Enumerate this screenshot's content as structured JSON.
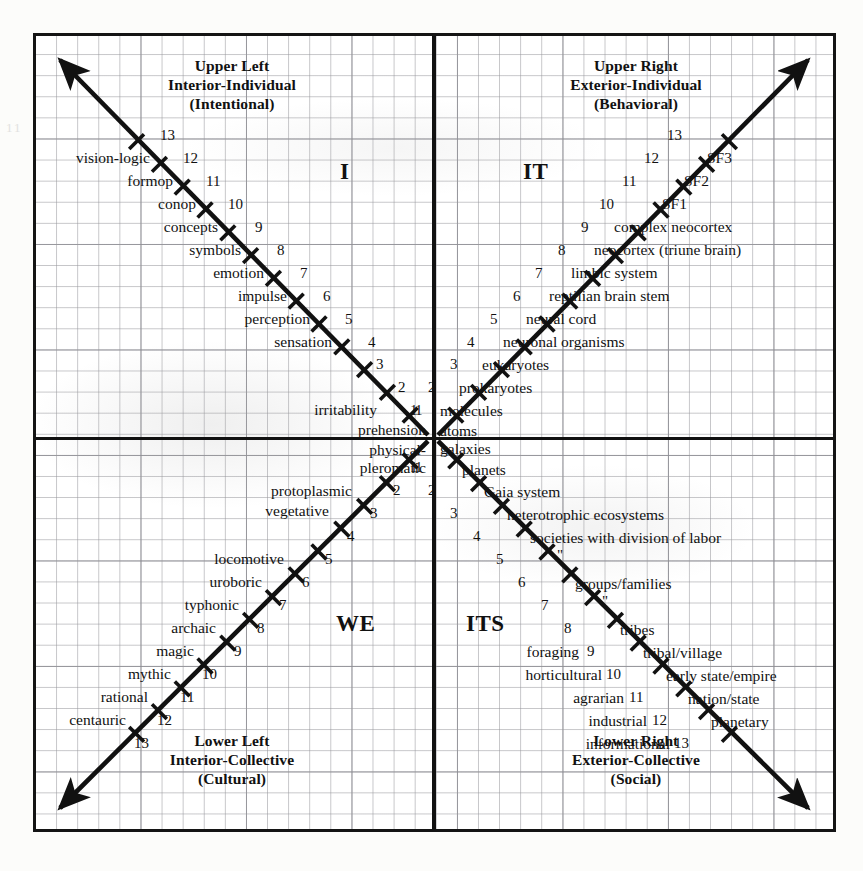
{
  "diagram": {
    "axis_color": "#111111",
    "grid_color": "#969699",
    "frame_color": "#141414"
  },
  "quadrants": {
    "upper_left": {
      "letter": "I",
      "title_line1": "Upper Left",
      "title_line2": "Interior-Individual",
      "title_line3": "(Intentional)"
    },
    "upper_right": {
      "letter": "IT",
      "title_line1": "Upper Right",
      "title_line2": "Exterior-Individual",
      "title_line3": "(Behavioral)"
    },
    "lower_left": {
      "letter": "WE",
      "title_line1": "Lower Left",
      "title_line2": "Interior-Collective",
      "title_line3": "(Cultural)"
    },
    "lower_right": {
      "letter": "ITS",
      "title_line1": "Lower Right",
      "title_line2": "Exterior-Collective",
      "title_line3": "(Social)"
    }
  },
  "chart_data": {
    "type": "diagram",
    "axes": [
      "interior-exterior (horizontal)",
      "individual-collective (vertical)"
    ],
    "levels_per_arm": 13,
    "arms": [
      {
        "quadrant": "upper_left",
        "letter": "I",
        "direction": "up-left",
        "numbers": [
          1,
          2,
          3,
          4,
          5,
          6,
          7,
          8,
          9,
          10,
          11,
          12,
          13
        ],
        "labels": [
          "physical-pleromatic",
          "prehension",
          "irritability",
          "",
          "sensation",
          "perception",
          "impulse",
          "emotion",
          "symbols",
          "concepts",
          "conop",
          "formop",
          "vision-logic"
        ]
      },
      {
        "quadrant": "upper_right",
        "letter": "IT",
        "direction": "up-right",
        "numbers": [
          1,
          2,
          3,
          4,
          5,
          6,
          7,
          8,
          9,
          10,
          11,
          12,
          13
        ],
        "labels": [
          "molecules",
          "prokaryotes",
          "eukaryotes",
          "neuronal organisms",
          "neural cord",
          "reptilian brain stem",
          "limbic system",
          "neocortex (triune brain)",
          "complex neocortex",
          "SF1",
          "SF2",
          "SF3",
          ""
        ],
        "origin_label": "atoms"
      },
      {
        "quadrant": "lower_left",
        "letter": "WE",
        "direction": "down-left",
        "numbers": [
          1,
          2,
          3,
          4,
          5,
          6,
          7,
          8,
          9,
          10,
          11,
          12,
          13
        ],
        "labels": [
          "physical-pleromatic",
          "protoplasmic",
          "vegetative",
          "",
          "locomotive",
          "uroboric",
          "typhonic",
          "archaic",
          "magic",
          "mythic",
          "rational",
          "centauric",
          ""
        ]
      },
      {
        "quadrant": "lower_right",
        "letter": "ITS",
        "direction": "down-right",
        "numbers": [
          1,
          2,
          3,
          4,
          5,
          6,
          7,
          8,
          9,
          10,
          11,
          12,
          13
        ],
        "labels_right": [
          "planets",
          "Gaia system",
          "heterotrophic ecosystems",
          "societies with division of labor",
          "\"",
          "groups/families",
          "\"",
          "tribes",
          "tribal/village",
          "early state/empire",
          "nation/state",
          "planetary",
          ""
        ],
        "labels_left": [
          "",
          "",
          "",
          "",
          "",
          "",
          "",
          "",
          "foraging",
          "horticultural",
          "agrarian",
          "industrial",
          "informational"
        ],
        "origin_label": "galaxies"
      }
    ]
  },
  "ul": {
    "n": [
      "1",
      "2",
      "3",
      "4",
      "5",
      "6",
      "7",
      "8",
      "9",
      "10",
      "11",
      "12",
      "13"
    ],
    "t1": "prehension",
    "t2": "irritability",
    "t5": "sensation",
    "t6": "perception",
    "t7": "impulse",
    "t8": "emotion",
    "t9": "symbols",
    "t10": "concepts",
    "t11": "conop",
    "t12": "formop",
    "t13": "vision-logic",
    "origin_a": "physical-",
    "origin_b": "pleromatic"
  },
  "ur": {
    "n": [
      "1",
      "2",
      "3",
      "4",
      "5",
      "6",
      "7",
      "8",
      "9",
      "10",
      "11",
      "12",
      "13"
    ],
    "origin": "atoms",
    "t1": "molecules",
    "t2": "prokaryotes",
    "t3": "eukaryotes",
    "t4": "neuronal organisms",
    "t5": "neural cord",
    "t6": "reptilian brain stem",
    "t7": "limbic system",
    "t8": "neocortex (triune brain)",
    "t9": "complex neocortex",
    "t10": "SF1",
    "t11": "SF2",
    "t12": "SF3"
  },
  "ll": {
    "n": [
      "1",
      "2",
      "3",
      "4",
      "5",
      "6",
      "7",
      "8",
      "9",
      "10",
      "11",
      "12",
      "13"
    ],
    "t2": "protoplasmic",
    "t3": "vegetative",
    "t5": "locomotive",
    "t6": "uroboric",
    "t7": "typhonic",
    "t8": "archaic",
    "t9": "magic",
    "t10": "mythic",
    "t11": "rational",
    "t12": "centauric"
  },
  "lr": {
    "n": [
      "1",
      "2",
      "3",
      "4",
      "5",
      "6",
      "7",
      "8",
      "9",
      "10",
      "11",
      "12",
      "13"
    ],
    "origin": "galaxies",
    "t1": "planets",
    "t2": "Gaia system",
    "t3": "heterotrophic ecosystems",
    "t4": "societies with division of labor",
    "t5": "\"",
    "t6": "groups/families",
    "t7": "\"",
    "t8": "tribes",
    "t9": "tribal/village",
    "t10": "early state/empire",
    "t11": "nation/state",
    "t12": "planetary",
    "l9": "foraging",
    "l10": "horticultural",
    "l11": "agrarian",
    "l12": "industrial",
    "l13": "informational"
  }
}
